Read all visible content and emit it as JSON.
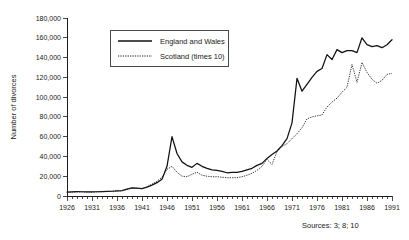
{
  "chart_data": {
    "type": "line",
    "title": "",
    "xlabel": "",
    "ylabel": "Number of divorces",
    "xlim": [
      1926,
      1991
    ],
    "ylim": [
      0,
      180000
    ],
    "ytick_step": 20000,
    "xtick_step": 5,
    "grid": false,
    "legend_position": "top-center",
    "ytick_labels": [
      "0",
      "20,000",
      "40,000",
      "60,000",
      "80,000",
      "100,000",
      "120,000",
      "140,000",
      "160,000",
      "180,000"
    ],
    "ytick_values": [
      0,
      20000,
      40000,
      60000,
      80000,
      100000,
      120000,
      140000,
      160000,
      180000
    ],
    "xtick_labels": [
      "1926",
      "1931",
      "1936",
      "1941",
      "1946",
      "1951",
      "1956",
      "1961",
      "1966",
      "1971",
      "1976",
      "1981",
      "1986",
      "1991"
    ],
    "xtick_values": [
      1926,
      1931,
      1936,
      1941,
      1946,
      1951,
      1956,
      1961,
      1966,
      1971,
      1976,
      1981,
      1986,
      1991
    ],
    "x": [
      1926,
      1927,
      1928,
      1929,
      1930,
      1931,
      1932,
      1933,
      1934,
      1935,
      1936,
      1937,
      1938,
      1939,
      1940,
      1941,
      1942,
      1943,
      1944,
      1945,
      1946,
      1947,
      1948,
      1949,
      1950,
      1951,
      1952,
      1953,
      1954,
      1955,
      1956,
      1957,
      1958,
      1959,
      1960,
      1961,
      1962,
      1963,
      1964,
      1965,
      1966,
      1967,
      1968,
      1969,
      1970,
      1971,
      1972,
      1973,
      1974,
      1975,
      1976,
      1977,
      1978,
      1979,
      1980,
      1981,
      1982,
      1983,
      1984,
      1985,
      1986,
      1987,
      1988,
      1989,
      1990,
      1991
    ],
    "series": [
      {
        "name": "England and Wales",
        "style": "solid",
        "color": "#111111",
        "values": [
          4000,
          4200,
          4400,
          4300,
          4200,
          4100,
          4300,
          4500,
          4600,
          4800,
          5100,
          5400,
          7000,
          8300,
          8000,
          7500,
          9000,
          11000,
          13500,
          17000,
          30000,
          60000,
          43000,
          34500,
          31000,
          29000,
          33000,
          30000,
          28000,
          26500,
          26000,
          25000,
          23500,
          24000,
          24000,
          25000,
          26500,
          28000,
          31000,
          33000,
          38000,
          42000,
          45500,
          51000,
          58000,
          74000,
          119000,
          106000,
          113000,
          120000,
          126000,
          129000,
          143000,
          138000,
          148000,
          145000,
          147000,
          147000,
          145000,
          160000,
          153000,
          151000,
          152000,
          150000,
          153000,
          158000
        ]
      },
      {
        "name": "Scotland (times 10)",
        "style": "dotted",
        "color": "#222222",
        "values": [
          3800,
          4000,
          4200,
          4100,
          4000,
          4000,
          4200,
          4400,
          4500,
          4700,
          5000,
          5300,
          6800,
          8000,
          7700,
          7400,
          9200,
          12000,
          15000,
          19000,
          27000,
          30000,
          24000,
          20000,
          19500,
          22000,
          24000,
          21000,
          20000,
          19500,
          19500,
          19000,
          18500,
          18500,
          18500,
          19500,
          21000,
          23000,
          26000,
          30000,
          37000,
          32000,
          45000,
          50000,
          53000,
          58000,
          63000,
          69000,
          78000,
          80000,
          81000,
          82000,
          90000,
          95000,
          99000,
          105000,
          110000,
          133000,
          115000,
          135000,
          125000,
          118000,
          114000,
          117000,
          123000,
          124000
        ]
      }
    ],
    "annotations": [
      {
        "name": "sources-note",
        "text": "Sources: 3; 8; 10"
      }
    ]
  },
  "legend": {
    "items": [
      {
        "label": "England and Wales",
        "style": "solid"
      },
      {
        "label": "Scotland (times 10)",
        "style": "dotted"
      }
    ]
  },
  "footer": {
    "sources": "Sources: 3; 8; 10"
  }
}
